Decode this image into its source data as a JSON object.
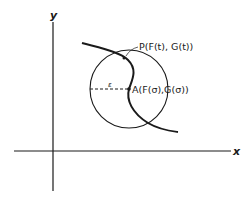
{
  "diagram": {
    "axes": {
      "x_label": "x",
      "y_label": "y"
    },
    "circle": {
      "radius_label": "ε"
    },
    "points": {
      "P": {
        "label": "P(F(t), G(t))"
      },
      "A": {
        "label": "A(F(σ),G(σ))"
      }
    },
    "colors": {
      "stroke": "#1a1a1a",
      "background": "#ffffff"
    }
  }
}
